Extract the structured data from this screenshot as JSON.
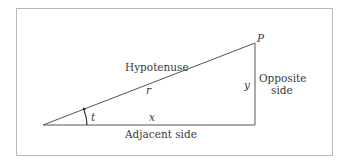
{
  "diagram": {
    "type": "right-triangle",
    "colors": {
      "line": "#555555",
      "frame": "#b8b8b8",
      "text": "#3a3a3a"
    },
    "vertices": {
      "origin": [
        43,
        125
      ],
      "right_angle": [
        255,
        125
      ],
      "apex": [
        255,
        43
      ]
    },
    "labels": {
      "point": "P",
      "hypotenuse": "Hypotenuse",
      "hypotenuse_var": "r",
      "adjacent": "Adjacent side",
      "adjacent_var": "x",
      "opposite_line1": "Opposite",
      "opposite_line2": "side",
      "opposite_var": "y",
      "angle": "t"
    }
  }
}
